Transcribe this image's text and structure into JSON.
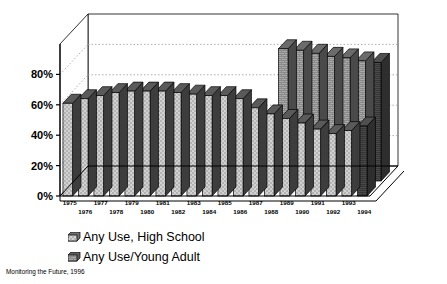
{
  "chart_data": {
    "type": "bar",
    "title": "",
    "subtitle": "",
    "xlabel": "",
    "ylabel": "",
    "ylim": [
      0,
      100
    ],
    "ytick_labels": [
      "0%",
      "20%",
      "40%",
      "60%",
      "80%"
    ],
    "ytick_values": [
      0,
      20,
      40,
      60,
      80
    ],
    "grid": true,
    "grid_style": "dotted horizontal gridlines on back wall",
    "legend_position": "bottom-left",
    "projection": "3d grouped bars, two rows in depth",
    "categories": [
      "1975",
      "1976",
      "1977",
      "1978",
      "1979",
      "1980",
      "1981",
      "1982",
      "1983",
      "1984",
      "1985",
      "1986",
      "1987",
      "1988",
      "1989",
      "1990",
      "1991",
      "1992",
      "1993",
      "1994"
    ],
    "series": [
      {
        "name": "Any Use, High School",
        "row": "front",
        "fill": "light gray checkered",
        "values": [
          61,
          64,
          66,
          68,
          69,
          69,
          69,
          68,
          67,
          66,
          66,
          64,
          58,
          54,
          51,
          48,
          44,
          41,
          43,
          46
        ]
      },
      {
        "name": "Any Use/Young Adult",
        "row": "back",
        "fill": "gray brick",
        "values": [
          null,
          null,
          null,
          null,
          null,
          null,
          null,
          null,
          null,
          null,
          null,
          null,
          null,
          87,
          86,
          84,
          82,
          81,
          79,
          78
        ]
      }
    ],
    "legend": [
      "Any Use, High School",
      "Any Use/Young Adult"
    ],
    "source": "Monitoring the Future, 1996",
    "colors": {
      "front_bar_face": "#c9c9c9",
      "front_bar_top": "#5a5a5a",
      "front_bar_side": "#3d3d3d",
      "back_bar_face": "#a8a8a8",
      "back_bar_top": "#6b6b6b",
      "back_bar_side": "#4a4a4a",
      "last_bar_dark": "#3a3a3a",
      "axis": "#000000",
      "gridline": "#999999",
      "background": "#ffffff"
    }
  },
  "legend": {
    "items": [
      {
        "label": "Any Use, High School",
        "swatch": "legend-swatch-high-school"
      },
      {
        "label": "Any Use/Young Adult",
        "swatch": "legend-swatch-young-adult"
      }
    ]
  },
  "axis": {
    "y_ticks": [
      {
        "label": "80%"
      },
      {
        "label": "60%"
      },
      {
        "label": "40%"
      },
      {
        "label": "20%"
      },
      {
        "label": "0%"
      }
    ],
    "x_ticks_top_row": [
      "1975",
      "1977",
      "1979",
      "1981",
      "1983",
      "1985",
      "1987",
      "1989",
      "1991",
      "1993"
    ],
    "x_ticks_bottom_row": [
      "1976",
      "1978",
      "1980",
      "1982",
      "1984",
      "1986",
      "1988",
      "1990",
      "1992",
      "1994"
    ]
  },
  "footer": {
    "source": "Monitoring the Future, 1996"
  }
}
